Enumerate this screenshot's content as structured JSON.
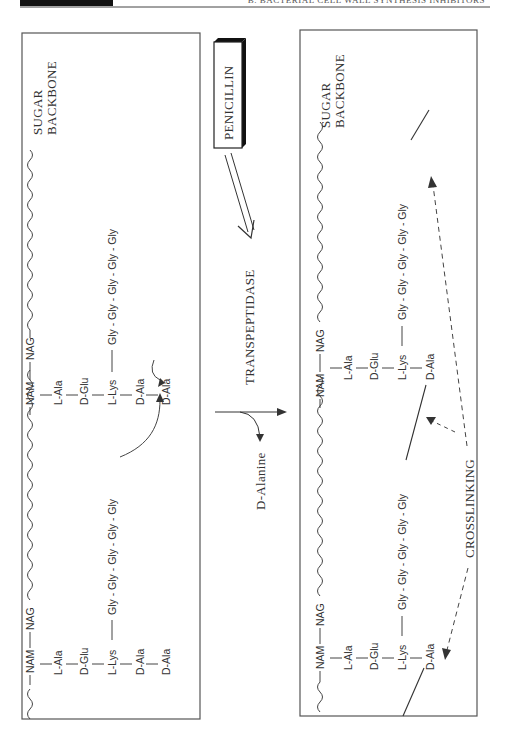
{
  "header": {
    "running_title": "B. BACTERIAL CELL WALL SYNTHESIS INHIBITORS"
  },
  "left_panel": {
    "backbone_label_line1": "SUGAR",
    "backbone_label_line2": "BACKBONE",
    "units": [
      {
        "nam": "NAM",
        "nag": "NAG",
        "chain": [
          "L-Ala",
          "D-Glu",
          "L-Lys",
          "D-Ala",
          "D-Ala"
        ],
        "bridge": "Gly - Gly - Gly - Gly - Gly"
      },
      {
        "nam": "NAM",
        "nag": "NAG",
        "chain": [
          "L-Ala",
          "D-Glu",
          "L-Lys",
          "D-Ala",
          "D-Ala"
        ],
        "bridge": "Gly - Gly - Gly - Gly - Gly"
      }
    ]
  },
  "middle": {
    "inhibitor": "PENICILLIN",
    "enzyme": "TRANSPEPTIDASE",
    "byproduct": "D-Alanine"
  },
  "right_panel": {
    "backbone_label_line1": "SUGAR",
    "backbone_label_line2": "BACKBONE",
    "units": [
      {
        "nam": "NAM",
        "nag": "NAG",
        "chain": [
          "L-Ala",
          "D-Glu",
          "L-Lys",
          "D-Ala"
        ],
        "bridge": "Gly - Gly - Gly - Gly - Gly"
      },
      {
        "nam": "NAM",
        "nag": "NAG",
        "chain": [
          "L-Ala",
          "D-Glu",
          "L-Lys",
          "D-Ala"
        ],
        "bridge": "Gly - Gly - Gly - Gly - Gly"
      }
    ],
    "crosslink_label": "CROSSLINKING"
  }
}
